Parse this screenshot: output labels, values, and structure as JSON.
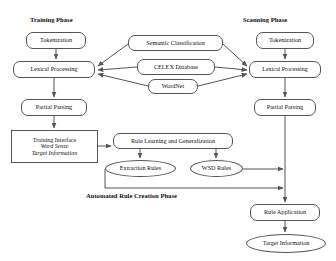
{
  "diagram": {
    "phases": [
      {
        "id": "training",
        "label": "Training Phase",
        "x": 30,
        "y": 16
      },
      {
        "id": "scanning",
        "label": "Scanning Phase",
        "x": 243,
        "y": 16
      },
      {
        "id": "automated",
        "label": "Automated Rule Creation Phase",
        "x": 86,
        "y": 192
      }
    ],
    "nodes": [
      {
        "id": "train-tokenization",
        "label": "Tokenization",
        "shape": "rounded",
        "x": 26,
        "y": 32,
        "w": 60,
        "h": 17,
        "fs": 6.2
      },
      {
        "id": "train-lexical",
        "label": "Lexical Processing",
        "shape": "rounded",
        "x": 13,
        "y": 61,
        "w": 82,
        "h": 17,
        "fs": 6.2
      },
      {
        "id": "train-partial",
        "label": "Partial Parsing",
        "shape": "rounded",
        "x": 21,
        "y": 99,
        "w": 66,
        "h": 17,
        "fs": 6.2
      },
      {
        "id": "training-interface",
        "label": "Training Interface",
        "shape": "rect",
        "x": 11,
        "y": 130,
        "w": 87,
        "h": 33,
        "fs": 6.0,
        "lines": [
          "Training Interface",
          "Word Sense",
          "Target Information"
        ],
        "italic_from": 1
      },
      {
        "id": "semantic-classification",
        "label": "Semantic Classification",
        "shape": "rounded",
        "x": 128,
        "y": 35,
        "w": 95,
        "h": 16,
        "fs": 6.2
      },
      {
        "id": "celex-database",
        "label": "CELEX Database",
        "shape": "rounded",
        "x": 137,
        "y": 59,
        "w": 78,
        "h": 16,
        "fs": 6.2
      },
      {
        "id": "wordnet",
        "label": "WordNet",
        "shape": "rounded",
        "x": 148,
        "y": 79,
        "w": 50,
        "h": 15,
        "fs": 6.2
      },
      {
        "id": "rule-learning",
        "label": "Rule Learning and Generalization",
        "shape": "rounded",
        "x": 113,
        "y": 133,
        "w": 120,
        "h": 16,
        "fs": 6.2
      },
      {
        "id": "extraction-rules",
        "label": "Extraction Rules",
        "shape": "ellipse",
        "x": 105,
        "y": 160,
        "w": 71,
        "h": 17,
        "fs": 6.2
      },
      {
        "id": "wsd-rules",
        "label": "WSD Rules",
        "shape": "ellipse",
        "x": 190,
        "y": 160,
        "w": 53,
        "h": 17,
        "fs": 6.2
      },
      {
        "id": "scan-tokenization",
        "label": "Tokenization",
        "shape": "rounded",
        "x": 256,
        "y": 32,
        "w": 58,
        "h": 17,
        "fs": 6.2
      },
      {
        "id": "scan-lexical",
        "label": "Lexical Processing",
        "shape": "rounded",
        "x": 249,
        "y": 61,
        "w": 72,
        "h": 17,
        "fs": 6.0
      },
      {
        "id": "scan-partial",
        "label": "Partial Parsing",
        "shape": "rounded",
        "x": 254,
        "y": 99,
        "w": 62,
        "h": 17,
        "fs": 6.2
      },
      {
        "id": "rule-application",
        "label": "Rule Application",
        "shape": "rounded",
        "x": 250,
        "y": 204,
        "w": 70,
        "h": 17,
        "fs": 6.2
      },
      {
        "id": "target-information",
        "label": "Target Information",
        "shape": "ellipse",
        "x": 246,
        "y": 234,
        "w": 80,
        "h": 19,
        "fs": 6.2
      }
    ],
    "edges": [
      {
        "id": "e-train-tok-lex",
        "from": "train-tokenization",
        "to": "train-lexical",
        "points": "56,49 56,59",
        "arrow": true
      },
      {
        "id": "e-train-lex-part",
        "from": "train-lexical",
        "to": "train-partial",
        "points": "54,78 54,97",
        "arrow": true
      },
      {
        "id": "e-train-part-ti",
        "from": "train-partial",
        "to": "training-interface",
        "points": "54,116 54,128",
        "arrow": true
      },
      {
        "id": "e-sem-trainlex",
        "from": "semantic-classification",
        "to": "train-lexical",
        "points": "128,44 98,66",
        "arrow": true
      },
      {
        "id": "e-celex-trainlex",
        "from": "celex-database",
        "to": "train-lexical",
        "points": "137,67 98,70",
        "arrow": true
      },
      {
        "id": "e-wordnet-trainlex",
        "from": "wordnet",
        "to": "train-lexical",
        "points": "148,86 98,74",
        "arrow": true
      },
      {
        "id": "e-sem-scanlex",
        "from": "semantic-classification",
        "to": "scan-lexical",
        "points": "223,44 247,66",
        "arrow": true
      },
      {
        "id": "e-celex-scanlex",
        "from": "celex-database",
        "to": "scan-lexical",
        "points": "215,67 247,70",
        "arrow": true
      },
      {
        "id": "e-wordnet-scanlex",
        "from": "wordnet",
        "to": "scan-lexical",
        "points": "198,86 247,74",
        "arrow": true
      },
      {
        "id": "e-ti-rulelearn",
        "from": "training-interface",
        "to": "rule-learning",
        "points": "98,146 111,146",
        "arrow": true
      },
      {
        "id": "e-rl-extraction",
        "from": "rule-learning",
        "to": "extraction-rules",
        "points": "140,149 140,158",
        "arrow": true
      },
      {
        "id": "e-rl-wsd",
        "from": "rule-learning",
        "to": "wsd-rules",
        "points": "216,149 216,158",
        "arrow": true
      },
      {
        "id": "e-wsd-ruleapp",
        "from": "wsd-rules",
        "to": "rule-application",
        "points": "243,169 283,169",
        "arrow": true
      },
      {
        "id": "e-extraction-ruleapp",
        "from": "extraction-rules",
        "to": "rule-application",
        "points": "105,188 283,188",
        "arrow": true
      },
      {
        "id": "e-extraction-down",
        "from": "extraction-rules",
        "to": "extraction-rules",
        "points": "105,169 105,188",
        "arrow": false
      },
      {
        "id": "e-scan-tok-lex",
        "from": "scan-tokenization",
        "to": "scan-lexical",
        "points": "285,49 285,59",
        "arrow": true
      },
      {
        "id": "e-scan-lex-part",
        "from": "scan-lexical",
        "to": "scan-partial",
        "points": "285,78 285,97",
        "arrow": true
      },
      {
        "id": "e-scan-part-ruleapp",
        "from": "scan-partial",
        "to": "rule-application",
        "points": "285,116 285,202",
        "arrow": true
      },
      {
        "id": "e-ruleapp-target",
        "from": "rule-application",
        "to": "target-information",
        "points": "285,221 285,232",
        "arrow": true
      }
    ],
    "style": {
      "line_color": "#555555",
      "node_border": "#555555",
      "text_color": "#111111",
      "background": "#ffffff"
    }
  }
}
